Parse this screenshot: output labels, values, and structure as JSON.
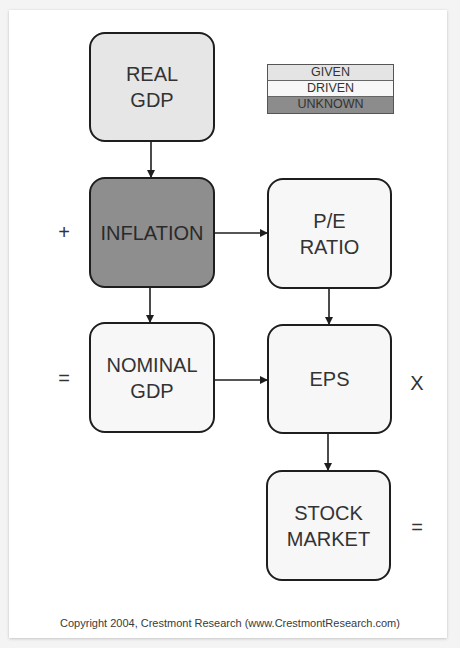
{
  "diagram": {
    "title": "",
    "nodes": [
      {
        "id": "real_gdp",
        "label": "REAL\nGDP",
        "status": "given",
        "fill": "#e6e6e6"
      },
      {
        "id": "inflation",
        "label": "INFLATION",
        "status": "unknown",
        "fill": "#8e8e8e"
      },
      {
        "id": "nominal_gdp",
        "label": "NOMINAL\nGDP",
        "status": "driven",
        "fill": "#f7f7f7"
      },
      {
        "id": "pe_ratio",
        "label": "P/E\nRATIO",
        "status": "driven",
        "fill": "#f7f7f7"
      },
      {
        "id": "eps",
        "label": "EPS",
        "status": "driven",
        "fill": "#f7f7f7"
      },
      {
        "id": "stock_market",
        "label": "STOCK\nMARKET",
        "status": "driven",
        "fill": "#f7f7f7"
      }
    ],
    "edges": [
      {
        "from": "real_gdp",
        "to": "inflation"
      },
      {
        "from": "inflation",
        "to": "nominal_gdp"
      },
      {
        "from": "inflation",
        "to": "pe_ratio"
      },
      {
        "from": "nominal_gdp",
        "to": "eps"
      },
      {
        "from": "pe_ratio",
        "to": "eps"
      },
      {
        "from": "eps",
        "to": "stock_market"
      }
    ],
    "operators": {
      "plus": "+",
      "equals_left": "=",
      "times": "X",
      "equals_right": "="
    }
  },
  "legend": {
    "items": [
      {
        "label": "GIVEN",
        "color": "#e4e4e4"
      },
      {
        "label": "DRIVEN",
        "color": "#f7f7f7"
      },
      {
        "label": "UNKNOWN",
        "color": "#8c8c8c"
      }
    ]
  },
  "footer": {
    "copyright": "Copyright 2004, Crestmont Research (www.CrestmontResearch.com)"
  }
}
